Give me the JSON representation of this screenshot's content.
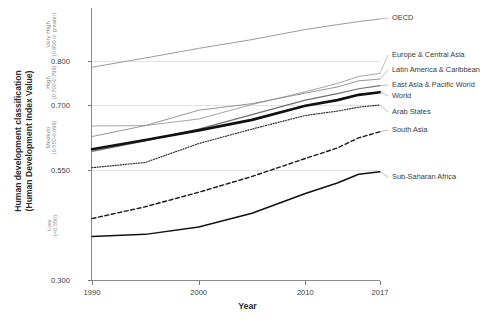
{
  "chart_data": {
    "type": "line",
    "title": "",
    "xlabel": "Year",
    "ylabel_line1": "Human development classification",
    "ylabel_line2": "(Human Development Index Value)",
    "xlim": [
      1990,
      2017
    ],
    "ylim": [
      0.3,
      0.92
    ],
    "grid": true,
    "legend_position": "right-inline",
    "x_ticks": [
      "1990",
      "2000",
      "2010",
      "2017"
    ],
    "x_tick_values": [
      1990,
      2000,
      2010,
      2017
    ],
    "y_ticks": [
      "0.300",
      "0.550",
      "0.700",
      "0.800"
    ],
    "y_tick_values": [
      0.3,
      0.55,
      0.7,
      0.8
    ],
    "classification_bands": [
      {
        "name": "Very High",
        "range": "(0.800 or greater)",
        "from": 0.8,
        "to": 0.92
      },
      {
        "name": "High",
        "range": "(0.700-0.799)",
        "from": 0.7,
        "to": 0.8
      },
      {
        "name": "Medium",
        "range": "(0.550-0.699)",
        "from": 0.55,
        "to": 0.7
      },
      {
        "name": "Low",
        "range": "(<0.550)",
        "from": 0.3,
        "to": 0.55
      }
    ],
    "x": [
      1990,
      1995,
      2000,
      2005,
      2010,
      2013,
      2015,
      2017
    ],
    "series": [
      {
        "name": "OECD",
        "style": "solid-thin-gray",
        "color": "#8e8e8e",
        "values": [
          0.785,
          0.806,
          0.828,
          0.848,
          0.871,
          0.882,
          0.889,
          0.895
        ]
      },
      {
        "name": "Europe & Central Asia",
        "style": "solid-thin-gray",
        "color": "#9b9b9b",
        "values": [
          0.651,
          0.652,
          0.667,
          0.7,
          0.729,
          0.748,
          0.764,
          0.771
        ]
      },
      {
        "name": "Latin America & Caribbean",
        "style": "solid-thin-gray",
        "color": "#8a8a8a",
        "values": [
          0.627,
          0.652,
          0.687,
          0.702,
          0.726,
          0.74,
          0.754,
          0.758
        ]
      },
      {
        "name": "East Asia & Pacific World",
        "style": "solid-medium-gray",
        "color": "#6f6f6f",
        "values": [
          0.593,
          0.617,
          0.644,
          0.677,
          0.71,
          0.725,
          0.736,
          0.743
        ]
      },
      {
        "name": "World",
        "style": "solid-thick-black",
        "color": "#111111",
        "values": [
          0.598,
          0.619,
          0.641,
          0.665,
          0.697,
          0.71,
          0.722,
          0.728
        ]
      },
      {
        "name": "Arab States",
        "style": "dotted",
        "color": "#2b2b2b",
        "values": [
          0.556,
          0.568,
          0.611,
          0.644,
          0.675,
          0.685,
          0.694,
          0.699
        ]
      },
      {
        "name": "South Asia",
        "style": "dashed",
        "color": "#1a1a1a",
        "values": [
          0.44,
          0.467,
          0.5,
          0.536,
          0.577,
          0.601,
          0.624,
          0.638
        ]
      },
      {
        "name": "Sub-Saharan Africa",
        "style": "solid-black",
        "color": "#111111",
        "values": [
          0.399,
          0.404,
          0.421,
          0.452,
          0.497,
          0.521,
          0.541,
          0.547
        ]
      }
    ],
    "series_labels": [
      "OECD",
      "Europe & Central Asia",
      "Latin America & Caribbean",
      "East Asia & Pacific World",
      "World",
      "Arab States",
      "South Asia",
      "Sub-Saharan Africa"
    ]
  }
}
